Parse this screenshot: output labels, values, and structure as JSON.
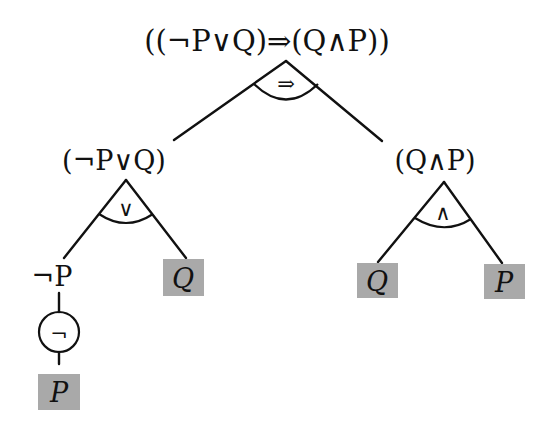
{
  "diagram": {
    "type": "parse-tree",
    "colors": {
      "line": "#111111",
      "leaf_fill": "#a9a9a9",
      "background": "#ffffff"
    },
    "root": {
      "label": "((¬P∨Q)⇒(Q∧P))",
      "connective": "⇒",
      "children": [
        "left_subtree",
        "right_subtree"
      ]
    },
    "left_subtree": {
      "label": "(¬P∨Q)",
      "connective": "∨",
      "children": [
        "neg_node",
        "left_leaf_q"
      ]
    },
    "right_subtree": {
      "label": "(Q∧P)",
      "connective": "∧",
      "children": [
        "right_leaf_q",
        "right_leaf_p"
      ]
    },
    "neg_node": {
      "label": "¬P",
      "connective": "¬",
      "child": "neg_leaf_p"
    },
    "left_leaf_q": {
      "label": "Q",
      "shaded": true
    },
    "right_leaf_q": {
      "label": "Q",
      "shaded": true
    },
    "right_leaf_p": {
      "label": "P",
      "shaded": true
    },
    "neg_leaf_p": {
      "label": "P",
      "shaded": true
    }
  }
}
